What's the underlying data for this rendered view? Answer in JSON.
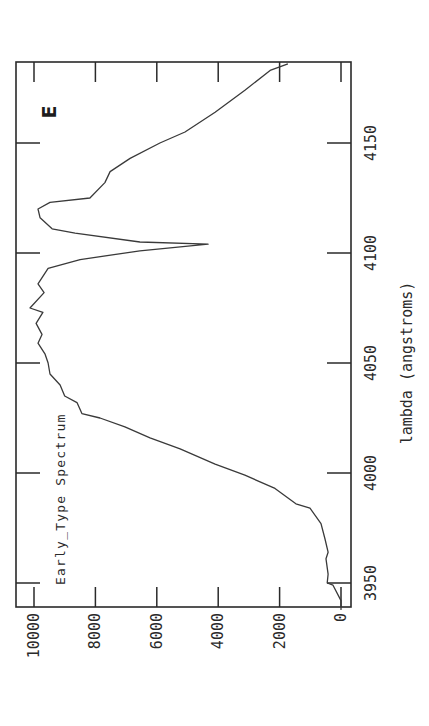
{
  "chart_data": {
    "type": "line",
    "orientation_note": "figure printed rotated 90 degrees counter-clockwise",
    "title": "",
    "annotation": "Early_Type Spectrum",
    "panel_label": "E",
    "xlabel": "lambda (angstroms)",
    "ylabel": "",
    "xlim": [
      3935,
      4190
    ],
    "ylim": [
      -300,
      10700
    ],
    "xticks": [
      3950,
      4000,
      4050,
      4100,
      4150
    ],
    "xtick_labels": [
      "3950",
      "4000",
      "4050",
      "4100",
      "4150"
    ],
    "yticks": [
      0,
      2000,
      4000,
      6000,
      8000,
      10000
    ],
    "ytick_labels": [
      "0",
      "2000",
      "4000",
      "6000",
      "8000",
      "10000"
    ],
    "grid": false,
    "legend": null,
    "series": [
      {
        "name": "Early_Type Spectrum",
        "x": [
          3938,
          3942,
          3949,
          3950,
          3954,
          3961,
          3964,
          3970,
          3977,
          3984,
          3986,
          3993,
          3999,
          4004,
          4011,
          4016,
          4021,
          4025,
          4027,
          4032,
          4035,
          4040,
          4045,
          4050,
          4054,
          4059,
          4063,
          4068,
          4073,
          4075,
          4082,
          4086,
          4093,
          4097,
          4101,
          4104,
          4105,
          4109,
          4111,
          4116,
          4120,
          4123,
          4125,
          4132,
          4137,
          4143,
          4150,
          4155,
          4164,
          4174,
          4183,
          4186
        ],
        "y": [
          0,
          0,
          260,
          450,
          420,
          490,
          420,
          520,
          650,
          1010,
          1470,
          2150,
          3130,
          4100,
          5240,
          6220,
          7040,
          7850,
          8440,
          8600,
          9000,
          9150,
          9480,
          9540,
          9640,
          9870,
          9740,
          9930,
          9710,
          10130,
          9670,
          9870,
          9540,
          8500,
          6550,
          4330,
          6550,
          8660,
          9410,
          9800,
          9870,
          9480,
          8180,
          7690,
          7520,
          6870,
          5900,
          5080,
          4100,
          3130,
          2310,
          1730
        ]
      }
    ]
  }
}
